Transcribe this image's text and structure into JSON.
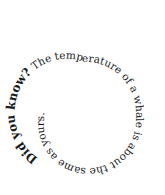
{
  "spiral_text": {
    "lead": "Did you know?",
    "body": " The temperature of a whale is about the same as yours.",
    "text_color": "#1a1a1a",
    "background": "#ffffff"
  }
}
